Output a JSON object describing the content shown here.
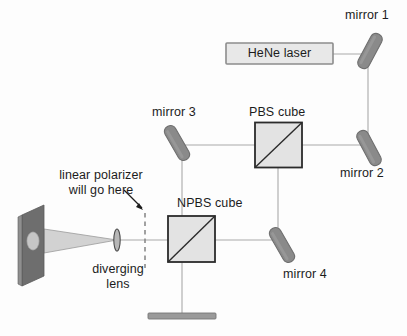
{
  "diagram": {
    "colors": {
      "background": "#fdfdfd",
      "beam_line": "#a9a9a9",
      "mirror_fill": "#8a8a8a",
      "mirror_stroke": "#6f6f6f",
      "cube_fill": "#e3e3e3",
      "cube_stroke": "#2b2b2b",
      "laser_fill": "#e8e8e8",
      "laser_stroke": "#8c8c8c",
      "screen_fill": "#6e6e6e",
      "screen_side": "#8f8f8f",
      "spot_fill": "#c6c6c6",
      "cone_fill": "#d2d2d2",
      "text": "#1c1c1c",
      "dashed": "#8a8a8a",
      "block_fill": "#9a9a9a"
    },
    "labels": {
      "laser": "HeNe laser",
      "mirror1": "mirror 1",
      "mirror2": "mirror 2",
      "mirror3": "mirror 3",
      "mirror4": "mirror 4",
      "pbs_cube": "PBS cube",
      "npbs_cube": "NPBS cube",
      "polarizer_note_line1": "linear polarizer",
      "polarizer_note_line2": "will go here",
      "lens_line1": "diverging",
      "lens_line2": "lens"
    },
    "components": [
      {
        "name": "hene-laser",
        "kind": "source",
        "label": "HeNe laser"
      },
      {
        "name": "mirror-1",
        "kind": "mirror",
        "label": "mirror 1"
      },
      {
        "name": "mirror-2",
        "kind": "mirror",
        "label": "mirror 2"
      },
      {
        "name": "mirror-3",
        "kind": "mirror",
        "label": "mirror 3"
      },
      {
        "name": "mirror-4",
        "kind": "mirror",
        "label": "mirror 4"
      },
      {
        "name": "pbs-cube",
        "kind": "beamsplitter",
        "label": "PBS cube"
      },
      {
        "name": "npbs-cube",
        "kind": "beamsplitter",
        "label": "NPBS cube"
      },
      {
        "name": "diverging-lens",
        "kind": "lens",
        "label": "diverging lens"
      },
      {
        "name": "linear-polarizer-placeholder",
        "kind": "placeholder",
        "label": "linear polarizer will go here"
      },
      {
        "name": "projection-screen",
        "kind": "screen",
        "label": ""
      },
      {
        "name": "beam-block",
        "kind": "beam-dump",
        "label": ""
      }
    ]
  }
}
